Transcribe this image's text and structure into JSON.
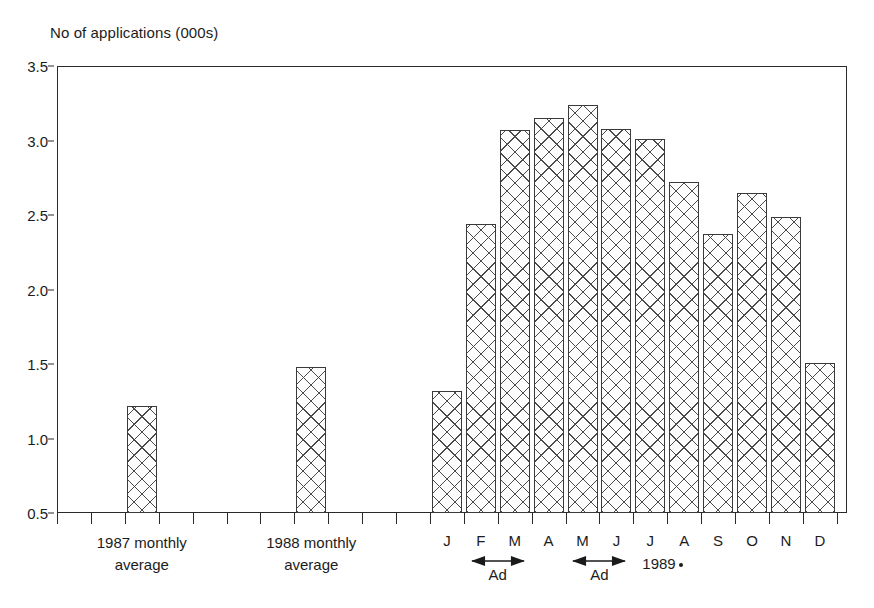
{
  "chart_data": {
    "type": "bar",
    "title": "No of applications (000s)",
    "xlabel": "",
    "ylabel": "No of applications (000s)",
    "ylim": [
      0.5,
      3.5
    ],
    "ytick_labels": [
      "3.5",
      "3.0",
      "2.5",
      "2.0",
      "1.5",
      "1.0",
      "0.5"
    ],
    "ytick_values": [
      3.5,
      3.0,
      2.5,
      2.0,
      1.5,
      1.0,
      0.5
    ],
    "grid": false,
    "legend": "none",
    "categories": [
      "1987 monthly average",
      "1988 monthly average",
      "J",
      "F",
      "M",
      "A",
      "M",
      "J",
      "J",
      "A",
      "S",
      "O",
      "N",
      "D"
    ],
    "values": [
      1.22,
      1.48,
      1.32,
      2.44,
      3.07,
      3.15,
      3.24,
      3.08,
      3.01,
      2.72,
      2.37,
      2.65,
      2.49,
      1.51
    ],
    "series": [
      {
        "name": "No of applications (000s)",
        "values": [
          1.22,
          1.48,
          1.32,
          2.44,
          3.07,
          3.15,
          3.24,
          3.08,
          3.01,
          2.72,
          2.37,
          2.65,
          2.49,
          1.51
        ]
      }
    ],
    "bar_fill": "cross-hatch",
    "annotations": [
      {
        "text": "Ad",
        "span": [
          "F",
          "M"
        ]
      },
      {
        "text": "Ad",
        "span": [
          "M",
          "J"
        ]
      },
      {
        "text": "1989",
        "marker": "dot"
      }
    ]
  },
  "axes": {
    "y_title": "No of applications (000s)",
    "y_ticks": [
      "3.5",
      "3.0",
      "2.5",
      "2.0",
      "1.5",
      "1.0",
      "0.5"
    ]
  },
  "x_axis": {
    "group_labels": [
      {
        "line1": "1987 monthly",
        "line2": "average"
      },
      {
        "line1": "1988 monthly",
        "line2": "average"
      }
    ],
    "months": [
      "J",
      "F",
      "M",
      "A",
      "M",
      "J",
      "J",
      "A",
      "S",
      "O",
      "N",
      "D"
    ],
    "year_label": "1989",
    "ad_labels": [
      "Ad",
      "Ad"
    ]
  },
  "style": {
    "axis_color": "#2a2a2a",
    "bar_outline": "#3a3a3a",
    "bar_hatch": "#4a4a4a",
    "background": "#ffffff"
  }
}
